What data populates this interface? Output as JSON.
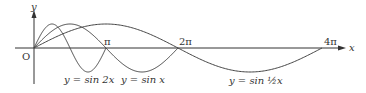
{
  "diagram": {
    "axes": {
      "x_label": "x",
      "y_label": "y",
      "origin_label": "O",
      "ticks": [
        "π",
        "2π",
        "4π"
      ]
    },
    "curves": [
      {
        "name": "sin2x",
        "label": "y = sin 2x",
        "period": "π"
      },
      {
        "name": "sinx",
        "label": "y = sin x",
        "period": "2π"
      },
      {
        "name": "sinhalfx",
        "label": "y = sin ½x",
        "period": "4π"
      }
    ],
    "colors": {
      "stroke": "#444444",
      "text": "#333333",
      "background": "#ffffff"
    }
  }
}
